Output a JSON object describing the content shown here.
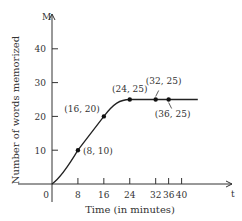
{
  "chart_data": {
    "type": "line",
    "title": "",
    "xlabel": "Time (in minutes)",
    "ylabel": "Number of words memorized",
    "x_axis_name": "t",
    "y_axis_name": "M",
    "x_ticks": [
      0,
      8,
      16,
      24,
      32,
      36,
      40
    ],
    "y_ticks": [
      10,
      20,
      30,
      40
    ],
    "xlim": [
      0,
      45
    ],
    "ylim": [
      0,
      50
    ],
    "grid": false,
    "series": [
      {
        "name": "M(t)",
        "x": [
          0,
          8,
          16,
          24,
          32,
          36,
          40,
          45
        ],
        "values": [
          0,
          10,
          20,
          25,
          25,
          25,
          25,
          25
        ]
      }
    ],
    "annotations": [
      {
        "label": "(8, 10)",
        "x": 8,
        "y": 10
      },
      {
        "label": "(16, 20)",
        "x": 16,
        "y": 20
      },
      {
        "label": "(24, 25)",
        "x": 24,
        "y": 25
      },
      {
        "label": "(32, 25)",
        "x": 32,
        "y": 25
      },
      {
        "label": "(36, 25)",
        "x": 36,
        "y": 25
      }
    ]
  }
}
